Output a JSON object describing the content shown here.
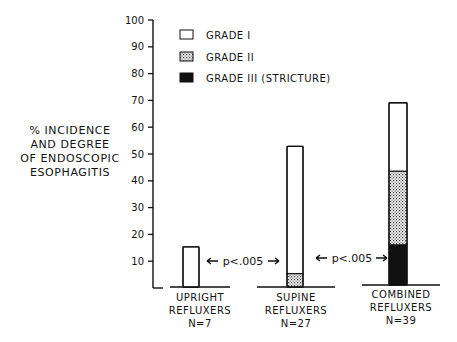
{
  "chart_data": {
    "type": "bar",
    "stacked": true,
    "title": "",
    "ylabel": [
      "% INCIDENCE",
      "AND DEGREE",
      "OF ENDOSCOPIC",
      "ESOPHAGITIS"
    ],
    "xlabel": "",
    "ylim": [
      0,
      100
    ],
    "yticks": [
      10,
      20,
      30,
      40,
      50,
      60,
      70,
      80,
      90,
      100
    ],
    "grid": false,
    "legend_position": "top-left",
    "categories": [
      {
        "lines": [
          "UPRIGHT",
          "REFLUXERS",
          "N=7"
        ]
      },
      {
        "lines": [
          "SUPINE",
          "REFLUXERS",
          "N=27"
        ]
      },
      {
        "lines": [
          "COMBINED",
          "REFLUXERS",
          "N=39"
        ]
      }
    ],
    "series": [
      {
        "name": "GRADE III (STRICTURE)",
        "fill": "solid-black",
        "values": [
          0,
          0,
          15
        ]
      },
      {
        "name": "GRADE II",
        "fill": "stipple",
        "values": [
          0,
          5,
          27.5
        ]
      },
      {
        "name": "GRADE I",
        "fill": "white",
        "values": [
          15,
          47.5,
          25.5
        ]
      }
    ],
    "legend": [
      {
        "label": "GRADE I",
        "fill": "white"
      },
      {
        "label": "GRADE II",
        "fill": "stipple"
      },
      {
        "label": "GRADE III (STRICTURE)",
        "fill": "solid-black"
      }
    ],
    "annotations": [
      {
        "text": "p<.005",
        "between": [
          "UPRIGHT REFLUXERS",
          "SUPINE REFLUXERS"
        ],
        "at_value": 10
      },
      {
        "text": "p<.005",
        "between": [
          "SUPINE REFLUXERS",
          "COMBINED REFLUXERS"
        ],
        "at_value": 10
      }
    ]
  }
}
